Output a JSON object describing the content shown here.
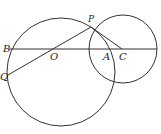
{
  "diagram": {
    "type": "geometry",
    "stroke_color": "#333333",
    "big_circle": {
      "cx": 61,
      "cy": 72,
      "r": 54
    },
    "small_circle": {
      "cx": 123,
      "cy": 49,
      "r": 34
    },
    "points": {
      "P": {
        "label": "P",
        "x": 91,
        "y": 27
      },
      "B": {
        "label": "B",
        "x": 9,
        "y": 49
      },
      "O": {
        "label": "O",
        "x": 51,
        "y": 49
      },
      "A": {
        "label": "A",
        "x": 106,
        "y": 49
      },
      "C": {
        "label": "C",
        "x": 122,
        "y": 49
      },
      "Q": {
        "label": "Q",
        "x": 8,
        "y": 75
      }
    },
    "segments": [
      {
        "from": "B",
        "to": "end",
        "x1": 9,
        "y1": 49,
        "x2": 157,
        "y2": 49
      },
      {
        "from": "Q",
        "to": "P",
        "x1": 8,
        "y1": 75,
        "x2": 91,
        "y2": 27
      },
      {
        "from": "P",
        "to": "C",
        "x1": 91,
        "y1": 27,
        "x2": 122,
        "y2": 49
      }
    ]
  }
}
